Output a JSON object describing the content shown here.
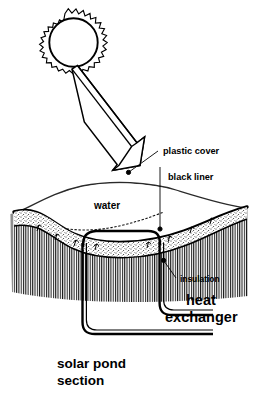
{
  "figure": {
    "title": "solar pond section",
    "caption_line1": "solar pond",
    "caption_line2": "section",
    "background_color": "#ffffff",
    "ink_color": "#000000"
  },
  "labels": {
    "plastic_cover": "plastic cover",
    "black_liner": "black liner",
    "water": "water",
    "insulation": "insulation",
    "heat_exchanger_line1": "heat",
    "heat_exchanger_line2": "exchanger"
  },
  "elements": {
    "sun": "sun-symbol",
    "sun_ray_arrow": "solar-radiation-arrow",
    "pond_body": "solar-pond-body",
    "ground": "ground-hatching",
    "heat_exchanger_pipe": "heat-exchanger-pipe-loop",
    "water_surface": "water-surface-wavy-line",
    "insulation_layer": "insulation-stipple-layer",
    "liner_layer": "black-liner-band"
  }
}
